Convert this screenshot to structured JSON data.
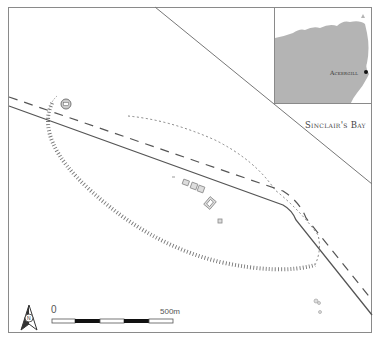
{
  "map": {
    "inset": {
      "place_label": "Ackergill",
      "land_color": "#b4b4b4"
    },
    "labels": {
      "bay": "Sinclair's Bay"
    },
    "scale_bar": {
      "start_label": "0",
      "end_label": "500m",
      "segments": [
        "white",
        "black",
        "white",
        "black",
        "white"
      ]
    },
    "north_arrow": {
      "label": "N"
    },
    "colors": {
      "frame": "#8a8a8a",
      "road": "#555555",
      "dashed_line": "#555555",
      "enclosure_hachure": "#777777",
      "features": "#888888"
    }
  }
}
